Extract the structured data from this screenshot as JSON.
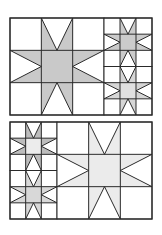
{
  "diagram": {
    "title": "Sawtooth star quilt block layouts",
    "colors": {
      "background": "#ffffff",
      "line": "#2a2a2a",
      "star_gray": "#c9c9c9",
      "star_mid": "#d8d8d8",
      "star_light": "#e4e4e4",
      "star_lightest": "#ececec",
      "star_points_dark": "#bdbdbd"
    },
    "panels": [
      {
        "name": "top-panel",
        "x": 10,
        "y": 18,
        "w": 142,
        "h": 97,
        "blocks": [
          {
            "name": "large-star-block",
            "x": 10,
            "y": 18,
            "size": 94,
            "height": 97,
            "center_fill": "#c9c9c9",
            "points_fill": "#c9c9c9"
          },
          {
            "name": "small-star-block-upper",
            "x": 104,
            "y": 18,
            "size": 48,
            "height": 48.5,
            "center_fill": "#cbcbcb",
            "points_fill": "#cbcbcb"
          },
          {
            "name": "small-star-block-lower",
            "x": 104,
            "y": 66.5,
            "size": 48,
            "height": 48.5,
            "center_fill": "#e0e0e0",
            "points_fill": "#d6d6d6"
          }
        ]
      },
      {
        "name": "bottom-panel",
        "x": 10,
        "y": 122,
        "w": 142,
        "h": 97,
        "blocks": [
          {
            "name": "small-star-block-upper",
            "x": 10,
            "y": 122,
            "size": 47,
            "height": 48.5,
            "center_fill": "#ececec",
            "points_fill": "#bdbdbd"
          },
          {
            "name": "small-star-block-lower",
            "x": 10,
            "y": 170.5,
            "size": 47,
            "height": 48.5,
            "center_fill": "#d8d8d8",
            "points_fill": "#d8d8d8"
          },
          {
            "name": "large-star-block",
            "x": 57,
            "y": 122,
            "size": 95,
            "height": 97,
            "center_fill": "#ebebeb",
            "points_fill": "#ebebeb"
          }
        ]
      }
    ]
  }
}
